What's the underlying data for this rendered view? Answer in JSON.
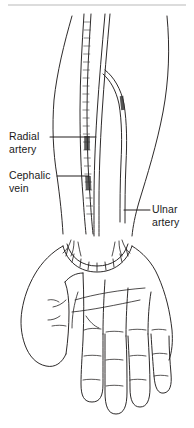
{
  "figure": {
    "view": "anterior (palmar) view of right forearm and hand",
    "line_color": "#221f1f",
    "top_rule_color": "#b8b8b8",
    "background_color": "#ffffff"
  },
  "labels": [
    {
      "id": "radial-artery",
      "line1": "Radial",
      "line2": "artery",
      "leader": {
        "x1": 50,
        "y1": 137,
        "x2": 96,
        "y2": 137
      }
    },
    {
      "id": "cephalic-vein",
      "line1": "Cephalic",
      "line2": "vein",
      "leader": {
        "x1": 57,
        "y1": 176,
        "x2": 89,
        "y2": 176
      }
    },
    {
      "id": "ulnar-artery",
      "line1": "Ulnar",
      "line2": "artery",
      "leader": {
        "x1": 124,
        "y1": 210,
        "x2": 150,
        "y2": 210
      }
    }
  ],
  "structures": {
    "forearm": "forearm outline tapering to wrist",
    "wrist_crease": "scalloped wrist crease with radiating tick marks",
    "palm": "open palm with thumb at left and four fingers",
    "cephalic_vein": "stippled superficial vein running along radial side",
    "radial_artery": "thin paired line, radial side of forearm",
    "ulnar_artery": "thin paired line, ulnar side, bifurcating in upper forearm"
  }
}
